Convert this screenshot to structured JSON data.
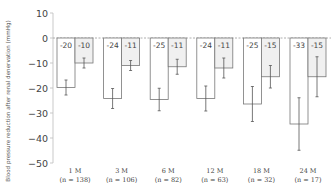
{
  "chart_data": {
    "type": "bar",
    "title": "",
    "xlabel": "",
    "ylabel": "Blood pressure reduction after renal denervation (mmHg)",
    "ylim": [
      -50,
      10
    ],
    "yticks": [
      10,
      0,
      -10,
      -20,
      -30,
      -40,
      -50
    ],
    "grid": false,
    "legend": null,
    "zero_line": "dashed",
    "categories": [
      "1 M",
      "3 M",
      "6 M",
      "12 M",
      "18 M",
      "24 M"
    ],
    "category_sublabels": [
      "(n = 138)",
      "(n = 106)",
      "(n = 82)",
      "(n = 63)",
      "(n = 32)",
      "(n = 17)"
    ],
    "series": [
      {
        "name": "Systolic",
        "color": "#ffffff",
        "values": [
          -20,
          -24,
          -25,
          -24,
          -25,
          -33
        ],
        "labels": [
          "-20",
          "-24",
          "-25",
          "-24",
          "-25",
          "-33"
        ],
        "plotted_values": [
          -19.8,
          -24.2,
          -24.6,
          -24.2,
          -26.4,
          -34.4
        ],
        "error": [
          3,
          4,
          4.5,
          5,
          7,
          10.5
        ]
      },
      {
        "name": "Diastolic",
        "color": "#f0f0f0",
        "values": [
          -10,
          -11,
          -11,
          -11,
          -15,
          -15
        ],
        "labels": [
          "-10",
          "-11",
          "-11",
          "-11",
          "-15",
          "-15"
        ],
        "plotted_values": [
          -10,
          -11,
          -11.5,
          -12,
          -15.5,
          -15.5
        ],
        "error": [
          2,
          2,
          3,
          4,
          4.5,
          8
        ]
      }
    ]
  }
}
